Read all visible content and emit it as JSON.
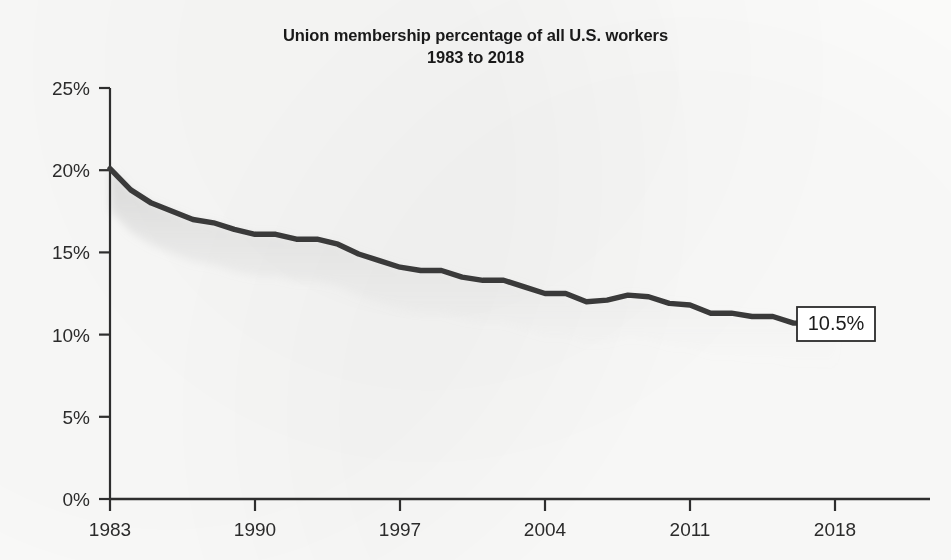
{
  "chart_data": {
    "type": "line",
    "title": "Union membership percentage of all U.S. workers",
    "subtitle": "1983 to 2018",
    "xlabel": "",
    "ylabel": "",
    "xlim": [
      1983,
      2018
    ],
    "ylim": [
      0,
      25
    ],
    "grid": false,
    "legend": "none",
    "x_tick_labels": [
      "1983",
      "1990",
      "1997",
      "2004",
      "2011",
      "2018"
    ],
    "x_tick_values": [
      1983,
      1990,
      1997,
      2004,
      2011,
      2018
    ],
    "y_tick_labels": [
      "0%",
      "5%",
      "10%",
      "15%",
      "20%",
      "25%"
    ],
    "y_tick_values": [
      0,
      5,
      10,
      15,
      20,
      25
    ],
    "series": [
      {
        "name": "Union membership percentage",
        "color": "#3a3a3a",
        "x": [
          1983,
          1984,
          1985,
          1986,
          1987,
          1988,
          1989,
          1990,
          1991,
          1992,
          1993,
          1994,
          1995,
          1996,
          1997,
          1998,
          1999,
          2000,
          2001,
          2002,
          2003,
          2004,
          2005,
          2006,
          2007,
          2008,
          2009,
          2010,
          2011,
          2012,
          2013,
          2014,
          2015,
          2016,
          2017,
          2018
        ],
        "values": [
          20.1,
          18.8,
          18.0,
          17.5,
          17.0,
          16.8,
          16.4,
          16.1,
          16.1,
          15.8,
          15.8,
          15.5,
          14.9,
          14.5,
          14.1,
          13.9,
          13.9,
          13.5,
          13.3,
          13.3,
          12.9,
          12.5,
          12.5,
          12.0,
          12.1,
          12.4,
          12.3,
          11.9,
          11.8,
          11.3,
          11.3,
          11.1,
          11.1,
          10.7,
          10.7,
          10.5
        ]
      }
    ],
    "annotations": [
      {
        "name": "end-value-label",
        "text": "10.5%",
        "x": 2018,
        "y": 10.5
      }
    ]
  }
}
